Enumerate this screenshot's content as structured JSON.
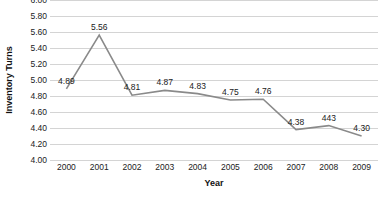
{
  "chart_data": {
    "type": "line",
    "title": "",
    "xlabel": "Year",
    "ylabel": "Inventory Turns",
    "categories": [
      "2000",
      "2001",
      "2002",
      "2003",
      "2004",
      "2005",
      "2006",
      "2007",
      "2008",
      "2009"
    ],
    "values": [
      4.89,
      5.56,
      4.81,
      4.87,
      4.83,
      4.75,
      4.76,
      4.38,
      4.43,
      4.3
    ],
    "point_labels": [
      "4.89",
      "5.56",
      "4.81",
      "4.87",
      "4.83",
      "4.75",
      "4.76",
      "4.38",
      "443",
      "4.30"
    ],
    "ylim": [
      4.0,
      6.0
    ],
    "ytick_step": 0.2,
    "ytick_labels": [
      "6.00",
      "5.80",
      "5.60",
      "5.40",
      "5.20",
      "5.00",
      "4.80",
      "4.60",
      "4.40",
      "4.20",
      "4.00"
    ],
    "ytick_values": [
      6.0,
      5.8,
      5.6,
      5.4,
      5.2,
      5.0,
      4.8,
      4.6,
      4.4,
      4.2,
      4.0
    ],
    "grid": true,
    "grid_axis": "y",
    "legend": false,
    "legend_position": "none",
    "series": [
      {
        "name": "Inventory Turns",
        "color": "#8a8a8a",
        "marker": "none",
        "values": [
          4.89,
          5.56,
          4.81,
          4.87,
          4.83,
          4.75,
          4.76,
          4.38,
          4.43,
          4.3
        ]
      }
    ],
    "colors": {
      "line": "#8a8a8a",
      "gridline": "#d4d4d4",
      "text": "#1a1a1a",
      "background": "#ffffff"
    }
  }
}
